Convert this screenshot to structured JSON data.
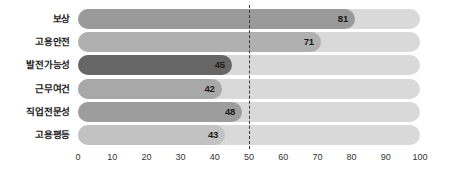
{
  "chart_data": {
    "type": "bar",
    "orientation": "horizontal",
    "title": "",
    "subtitle": "",
    "xlabel": "",
    "ylabel": "",
    "xlim": [
      0,
      100
    ],
    "xticks": [
      0,
      10,
      20,
      30,
      40,
      50,
      60,
      70,
      80,
      90,
      100
    ],
    "xtick_labels": [
      "0",
      "10",
      "20",
      "30",
      "40",
      "50",
      "60",
      "70",
      "80",
      "90",
      "100"
    ],
    "grid": false,
    "legend": false,
    "legend_position": "none",
    "categories": [
      "보상",
      "고용안전",
      "발전가능성",
      "근무여건",
      "직업전문성",
      "고용평등"
    ],
    "values": [
      81,
      71,
      45,
      42,
      48,
      43
    ],
    "value_labels": [
      "81",
      "71",
      "45",
      "42",
      "48",
      "43"
    ],
    "bar_colors": [
      "#9a9a9a",
      "#b0b0b0",
      "#666666",
      "#a8a8a8",
      "#9d9d9d",
      "#c2c2c2"
    ],
    "track_color": "#d9d9d9",
    "reference_line": {
      "value": 50,
      "style": "dashed",
      "color": "#3a3a3a"
    },
    "annotations": []
  },
  "colors": {
    "background": "#ffffff",
    "text": "#1a1a1a",
    "axis_text": "#333333"
  }
}
